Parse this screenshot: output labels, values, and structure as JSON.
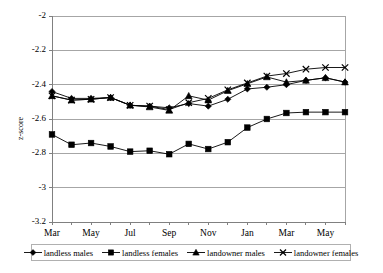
{
  "chart_data": {
    "type": "line",
    "title": "",
    "xlabel": "",
    "ylabel": "z-score",
    "ylim": [
      -3.2,
      -2
    ],
    "yticks": [
      "-2",
      "-2.2",
      "-2.4",
      "-2.6",
      "-2.8",
      "-3",
      "-3.2"
    ],
    "ytick_values": [
      -2,
      -2.2,
      -2.4,
      -2.6,
      -2.8,
      -3,
      -3.2
    ],
    "grid": true,
    "legend_position": "bottom",
    "x": [
      "Mar",
      "Apr",
      "May",
      "Jun",
      "Jul",
      "Aug",
      "Sep",
      "Oct",
      "Nov",
      "Dec",
      "Jan",
      "Feb",
      "Mar",
      "Apr",
      "May",
      "Jun"
    ],
    "xtick_labels": [
      "Mar",
      "May",
      "Jul",
      "Sep",
      "Nov",
      "Jan",
      "Mar",
      "May"
    ],
    "xtick_indices": [
      0,
      2,
      4,
      6,
      8,
      10,
      12,
      14
    ],
    "series": [
      {
        "name": "landless males",
        "marker": "diamond",
        "color": "#000000",
        "values": [
          -2.44,
          -2.48,
          -2.48,
          -2.475,
          -2.52,
          -2.525,
          -2.535,
          -2.51,
          -2.525,
          -2.485,
          -2.425,
          -2.415,
          -2.4,
          -2.375,
          -2.36,
          -2.385
        ]
      },
      {
        "name": "landless females",
        "marker": "square",
        "color": "#000000",
        "values": [
          -2.69,
          -2.75,
          -2.74,
          -2.76,
          -2.79,
          -2.785,
          -2.805,
          -2.745,
          -2.775,
          -2.735,
          -2.65,
          -2.6,
          -2.565,
          -2.56,
          -2.56,
          -2.56
        ]
      },
      {
        "name": "landowner males",
        "marker": "triangle",
        "color": "#000000",
        "values": [
          -2.465,
          -2.49,
          -2.485,
          -2.475,
          -2.52,
          -2.53,
          -2.55,
          -2.465,
          -2.49,
          -2.435,
          -2.395,
          -2.355,
          -2.385,
          -2.375,
          -2.36,
          -2.385
        ]
      },
      {
        "name": "landowner females",
        "marker": "x",
        "color": "#000000",
        "values": [
          -2.465,
          -2.49,
          -2.485,
          -2.475,
          -2.52,
          -2.525,
          -2.545,
          -2.505,
          -2.48,
          -2.43,
          -2.39,
          -2.35,
          -2.335,
          -2.31,
          -2.3,
          -2.3
        ]
      }
    ]
  },
  "axes": {
    "y_axis_title": "z-score"
  },
  "legend": {
    "items": [
      {
        "label": "landless males",
        "marker": "diamond"
      },
      {
        "label": "landless females",
        "marker": "square"
      },
      {
        "label": "landowner males",
        "marker": "triangle"
      },
      {
        "label": "landowner females",
        "marker": "x"
      }
    ]
  },
  "colors": {
    "line": "#000000",
    "grid": "#a6a6a6",
    "axis": "#808080",
    "plot_border": "#a6a6a6",
    "background": "#ffffff"
  }
}
